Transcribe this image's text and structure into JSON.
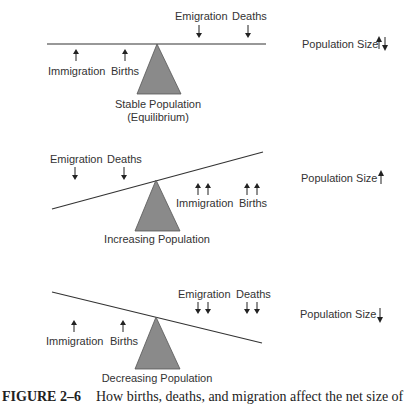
{
  "panels": [
    {
      "id": "stable",
      "label_line1": "Stable Population",
      "label_line2": "(Equilibrium)",
      "result_label": "Population Size",
      "result_icon": "up-down-arrows-icon",
      "left_forces": [
        {
          "label": "Immigration",
          "direction": "up",
          "count": 1
        },
        {
          "label": "Births",
          "direction": "up",
          "count": 1
        }
      ],
      "right_forces": [
        {
          "label": "Emigration",
          "direction": "down",
          "count": 1
        },
        {
          "label": "Deaths",
          "direction": "down",
          "count": 1
        }
      ],
      "tilt": "level"
    },
    {
      "id": "increasing",
      "label_line1": "Increasing Population",
      "result_label": "Population Size",
      "result_icon": "up-arrow-icon",
      "left_forces": [
        {
          "label": "Emigration",
          "direction": "down",
          "count": 1
        },
        {
          "label": "Deaths",
          "direction": "down",
          "count": 1
        }
      ],
      "right_forces": [
        {
          "label": "Immigration",
          "direction": "up",
          "count": 2
        },
        {
          "label": "Births",
          "direction": "up",
          "count": 2
        }
      ],
      "tilt": "rising-right"
    },
    {
      "id": "decreasing",
      "label_line1": "Decreasing Population",
      "result_label": "Population Size",
      "result_icon": "down-arrow-icon",
      "left_forces": [
        {
          "label": "Immigration",
          "direction": "up",
          "count": 1
        },
        {
          "label": "Births",
          "direction": "up",
          "count": 1
        }
      ],
      "right_forces": [
        {
          "label": "Emigration",
          "direction": "down",
          "count": 2
        },
        {
          "label": "Deaths",
          "direction": "down",
          "count": 2
        }
      ],
      "tilt": "falling-right"
    }
  ],
  "caption": {
    "number": "FIGURE 2–6",
    "text": "How births, deaths, and migration affect the net size of"
  },
  "colors": {
    "fulcrum": "#8a8a8a",
    "line": "#333333",
    "text": "#333333"
  }
}
